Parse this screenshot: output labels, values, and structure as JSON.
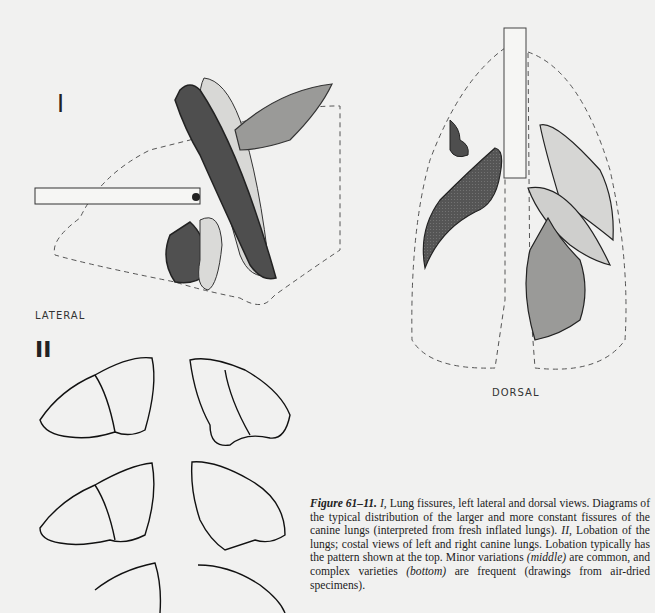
{
  "figure": {
    "part1_label": "I",
    "part2_label": "II",
    "lateral_label": "LATERAL",
    "dorsal_label": "DORSAL",
    "trachea_marker": "JG"
  },
  "caption": {
    "figure_number": "Figure 61–11.",
    "part1_marker": "I,",
    "part1_text": "Lung fissures, left lateral and dorsal views. Diagrams of the typical distribution of the larger and more constant fissures of the canine lungs (interpreted from fresh inflated lungs).",
    "part2_marker": "II,",
    "part2_text_a": "Lobation of the lungs; costal views of left and right canine lungs. Lobation typically has the pattern shown at the top. Minor variations",
    "middle": "(middle)",
    "part2_text_b": "are common, and complex varieties",
    "bottom": "(bottom)",
    "part2_text_c": "are frequent (drawings from air-dried specimens)."
  },
  "colors": {
    "dark_lobe": "#4a4a4a",
    "mid_lobe": "#8a8a8a",
    "light_lobe": "#cfcfcf",
    "outline": "#222222",
    "background": "#f1f1f0"
  }
}
